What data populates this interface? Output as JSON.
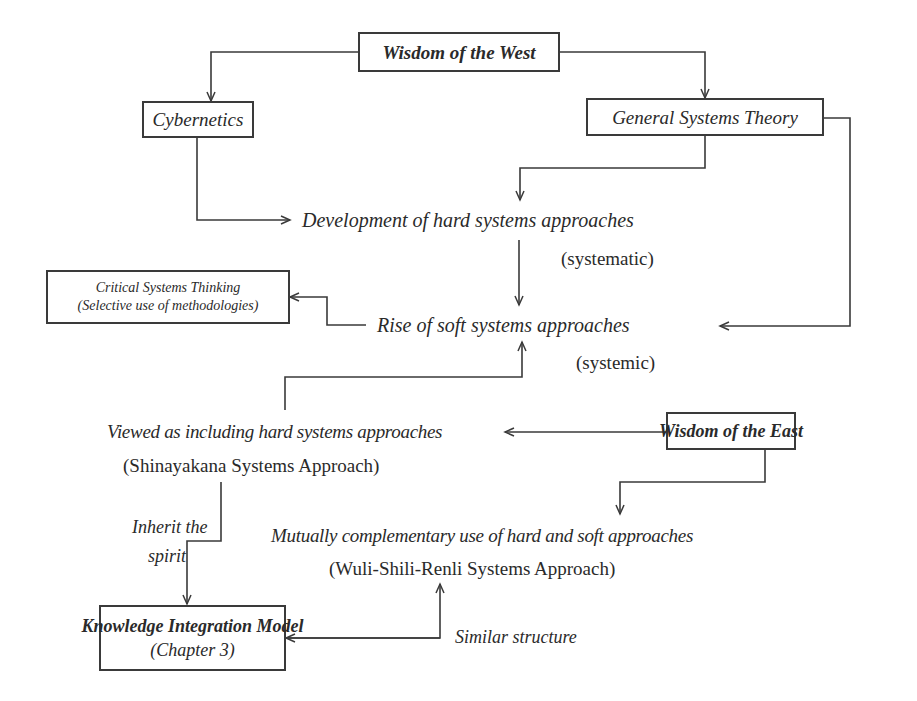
{
  "diagram": {
    "nodes": {
      "wisdom_west": {
        "label": "Wisdom of the West"
      },
      "cybernetics": {
        "label": "Cybernetics"
      },
      "general_systems_theory": {
        "label": "General Systems Theory"
      },
      "hard_systems": {
        "label": "Development of hard systems approaches",
        "note": "(systematic)"
      },
      "critical_systems": {
        "line1": "Critical Systems Thinking",
        "line2": "(Selective use of methodologies)"
      },
      "soft_systems": {
        "label": "Rise of soft systems approaches",
        "note": "(systemic)"
      },
      "shinayakana": {
        "label": "Viewed as including hard systems approaches",
        "note": "(Shinayakana Systems Approach)"
      },
      "wisdom_east": {
        "label": "Wisdom of the East"
      },
      "wsr": {
        "label": "Mutually complementary use of hard and soft approaches",
        "note": "(Wuli-Shili-Renli  Systems Approach)"
      },
      "knowledge_model": {
        "label": "Knowledge Integration Model",
        "note": "(Chapter 3)"
      }
    },
    "edge_labels": {
      "inherit_line1": "Inherit the",
      "inherit_line2": "spirit",
      "similar_structure": "Similar structure"
    },
    "colors": {
      "line": "#3a3a3a",
      "text": "#2a2a2a",
      "background": "#ffffff"
    }
  }
}
